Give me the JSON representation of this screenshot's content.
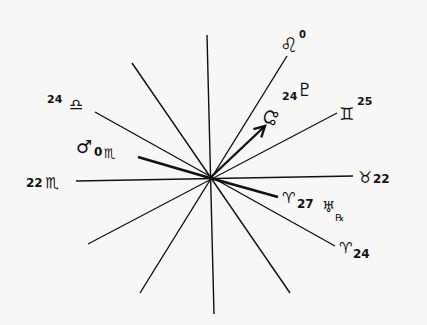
{
  "diagram": {
    "type": "astrological-aspect-wheel",
    "center": [
      210,
      178
    ],
    "colors": {
      "ink": "#111111",
      "paper": "#f7f7f5"
    },
    "spokes": [
      {
        "id": "vertical",
        "x1": 207,
        "y1": 35,
        "x2": 214,
        "y2": 314,
        "width": 1.4
      },
      {
        "id": "leo-line",
        "x1": 287,
        "y1": 56,
        "x2": 140,
        "y2": 293,
        "width": 1.4
      },
      {
        "id": "gemini-line",
        "x1": 337,
        "y1": 113,
        "x2": 88,
        "y2": 244,
        "width": 1.2
      },
      {
        "id": "taurus-scorpio-line",
        "x1": 353,
        "y1": 176,
        "x2": 76,
        "y2": 181,
        "width": 1.4
      },
      {
        "id": "libra-aries-line",
        "x1": 95,
        "y1": 112,
        "x2": 335,
        "y2": 246,
        "width": 1.4
      },
      {
        "id": "upper-left-line",
        "x1": 132,
        "y1": 63,
        "x2": 290,
        "y2": 293,
        "width": 1.4
      },
      {
        "id": "mars-line",
        "x1": 138,
        "y1": 157,
        "x2": 210,
        "y2": 178,
        "width": 2.4
      },
      {
        "id": "uranus-line",
        "x1": 210,
        "y1": 178,
        "x2": 278,
        "y2": 197,
        "width": 2.4
      }
    ],
    "arrow": {
      "id": "north-node-arrow",
      "x1": 210,
      "y1": 178,
      "x2": 265,
      "y2": 126,
      "width": 2.4
    },
    "labels": [
      {
        "id": "leo-0",
        "glyph": "♌",
        "degree": "0",
        "text": "Leo 0"
      },
      {
        "id": "pluto",
        "glyph": "♇",
        "text": "Pluto"
      },
      {
        "id": "node-24",
        "glyph": "☊",
        "degree": "24",
        "text": "Node 24"
      },
      {
        "id": "gemini-25",
        "glyph": "♊",
        "degree": "25",
        "text": "Gemini 25"
      },
      {
        "id": "libra-24",
        "glyph": "♎",
        "degree": "24",
        "text": "24 Libra"
      },
      {
        "id": "mars-0-scorpio",
        "glyph": "♂",
        "degree": "0",
        "sign": "♏",
        "text": "Mars 0 Scorpio"
      },
      {
        "id": "scorpio-22",
        "glyph": "♏",
        "degree": "22",
        "text": "22 Scorpio"
      },
      {
        "id": "taurus-22",
        "glyph": "♉",
        "degree": "22",
        "text": "Taurus 22"
      },
      {
        "id": "aries-27-uranus",
        "glyph": "♈",
        "degree": "27",
        "planet": "♅",
        "retro": "℞",
        "text": "Aries 27 Uranus R"
      },
      {
        "id": "aries-24",
        "glyph": "♈",
        "degree": "24",
        "text": "Aries 24"
      }
    ]
  }
}
